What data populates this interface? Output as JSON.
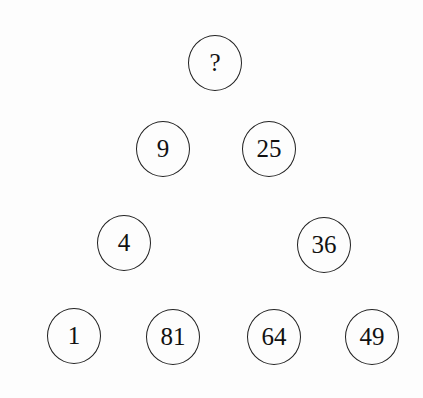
{
  "puzzle": {
    "description": "Number circles arranged in a triangle; find the missing value",
    "nodes": [
      {
        "id": "top",
        "label": "?",
        "x": 215,
        "y": 63
      },
      {
        "id": "row2-left",
        "label": "9",
        "x": 163,
        "y": 149
      },
      {
        "id": "row2-right",
        "label": "25",
        "x": 269,
        "y": 149
      },
      {
        "id": "row3-left",
        "label": "4",
        "x": 124,
        "y": 243
      },
      {
        "id": "row3-right",
        "label": "36",
        "x": 324,
        "y": 245
      },
      {
        "id": "row4-1",
        "label": "1",
        "x": 74,
        "y": 336
      },
      {
        "id": "row4-2",
        "label": "81",
        "x": 173,
        "y": 337
      },
      {
        "id": "row4-3",
        "label": "64",
        "x": 274,
        "y": 337
      },
      {
        "id": "row4-4",
        "label": "49",
        "x": 372,
        "y": 337
      }
    ]
  }
}
